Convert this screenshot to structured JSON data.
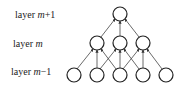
{
  "diagram": {
    "type": "layered-network",
    "layers": [
      {
        "name": "layer-m+1",
        "label_prefix": "layer ",
        "label_var": "m",
        "label_suffix": "+1",
        "nodes": 1
      },
      {
        "name": "layer-m",
        "label_prefix": "layer ",
        "label_var": "m",
        "label_suffix": "",
        "nodes": 3
      },
      {
        "name": "layer-m-1",
        "label_prefix": "layer ",
        "label_var": "m",
        "label_suffix": "−1",
        "nodes": 5
      }
    ],
    "connections": {
      "layer-m-1_to_layer-m": [
        [
          0,
          0
        ],
        [
          1,
          0
        ],
        [
          2,
          0
        ],
        [
          1,
          1
        ],
        [
          2,
          1
        ],
        [
          3,
          1
        ],
        [
          2,
          2
        ],
        [
          3,
          2
        ],
        [
          4,
          2
        ]
      ],
      "layer-m_to_layer-m+1": [
        [
          0,
          0
        ],
        [
          1,
          0
        ],
        [
          2,
          0
        ]
      ]
    }
  }
}
